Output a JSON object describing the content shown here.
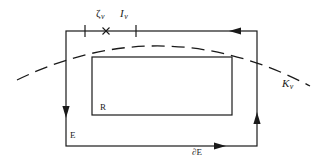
{
  "figure": {
    "labels": {
      "zeta_v": "ζ",
      "zeta_v_sub": "v",
      "i_v": "I",
      "i_v_sub": "v",
      "k_v": "K",
      "k_v_sub": "v",
      "region_inner": "R",
      "region_outer": "E",
      "boundary": "∂E"
    },
    "colors": {
      "stroke": "#1a1a1a",
      "background": "#ffffff"
    },
    "geometry": {
      "outer_rect": {
        "x": 66,
        "y": 31,
        "width": 191,
        "height": 115
      },
      "inner_rect": {
        "x": 92,
        "y": 57,
        "width": 140,
        "height": 58
      },
      "ticks_x": [
        85,
        136
      ],
      "cross_mark_x": 106,
      "tick_y": 31,
      "arrows": [
        {
          "edge": "top",
          "at": 237,
          "direction": "left"
        },
        {
          "edge": "left",
          "at": 110,
          "direction": "down"
        },
        {
          "edge": "right",
          "at": 120,
          "direction": "up"
        },
        {
          "edge": "bottom",
          "at": 218,
          "direction": "right"
        }
      ],
      "dashed_curve": {
        "start": [
          17,
          80
        ],
        "control": [
          163,
          9
        ],
        "end": [
          310,
          86
        ]
      }
    }
  }
}
